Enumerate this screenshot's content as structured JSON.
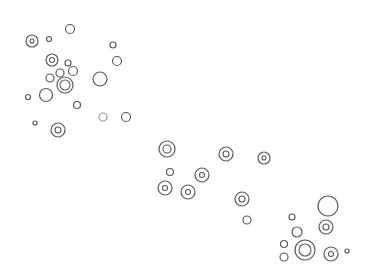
{
  "drawing": {
    "stroke_color": "#5a5a5a",
    "light_stroke_color": "#9a9a9a",
    "background": "#ffffff",
    "circles": [
      {
        "cx": 32,
        "cy": 41,
        "r": 6,
        "inner": 2
      },
      {
        "cx": 49,
        "cy": 39,
        "r": 2.5,
        "inner": 0
      },
      {
        "cx": 70,
        "cy": 29,
        "r": 4.5,
        "inner": 0
      },
      {
        "cx": 113,
        "cy": 45,
        "r": 3,
        "inner": 0
      },
      {
        "cx": 52,
        "cy": 60,
        "r": 6,
        "inner": 2.5
      },
      {
        "cx": 68,
        "cy": 63,
        "r": 3,
        "inner": 0
      },
      {
        "cx": 117,
        "cy": 61,
        "r": 4.5,
        "inner": 0
      },
      {
        "cx": 50,
        "cy": 78,
        "r": 4,
        "inner": 0
      },
      {
        "cx": 60,
        "cy": 73,
        "r": 4,
        "inner": 0
      },
      {
        "cx": 73,
        "cy": 71,
        "r": 4.5,
        "inner": 0
      },
      {
        "cx": 65,
        "cy": 85,
        "r": 8,
        "inner": 5
      },
      {
        "cx": 100,
        "cy": 79,
        "r": 7,
        "inner": 0
      },
      {
        "cx": 28,
        "cy": 97,
        "r": 2.5,
        "inner": 0
      },
      {
        "cx": 46,
        "cy": 95,
        "r": 6.5,
        "inner": 0
      },
      {
        "cx": 77,
        "cy": 105,
        "r": 3.5,
        "inner": 0
      },
      {
        "cx": 103,
        "cy": 117,
        "r": 4,
        "inner": 0,
        "light": true
      },
      {
        "cx": 126,
        "cy": 117,
        "r": 4.5,
        "inner": 0
      },
      {
        "cx": 35,
        "cy": 123,
        "r": 2,
        "inner": 0
      },
      {
        "cx": 58,
        "cy": 130,
        "r": 7,
        "inner": 3
      },
      {
        "cx": 167,
        "cy": 149,
        "r": 8,
        "inner": 4
      },
      {
        "cx": 226,
        "cy": 154,
        "r": 7,
        "inner": 3
      },
      {
        "cx": 264,
        "cy": 158,
        "r": 6,
        "inner": 2
      },
      {
        "cx": 170,
        "cy": 172,
        "r": 3.5,
        "inner": 0
      },
      {
        "cx": 202,
        "cy": 175,
        "r": 7,
        "inner": 2.5
      },
      {
        "cx": 165,
        "cy": 188,
        "r": 7,
        "inner": 2.5
      },
      {
        "cx": 188,
        "cy": 192,
        "r": 7,
        "inner": 2.5
      },
      {
        "cx": 242,
        "cy": 199,
        "r": 7,
        "inner": 3
      },
      {
        "cx": 247,
        "cy": 220,
        "r": 4,
        "inner": 0
      },
      {
        "cx": 328,
        "cy": 206,
        "r": 10,
        "inner": 0
      },
      {
        "cx": 292,
        "cy": 217,
        "r": 3,
        "inner": 0
      },
      {
        "cx": 326,
        "cy": 227,
        "r": 7,
        "inner": 3
      },
      {
        "cx": 297,
        "cy": 232,
        "r": 5,
        "inner": 0
      },
      {
        "cx": 284,
        "cy": 244,
        "r": 3.5,
        "inner": 0
      },
      {
        "cx": 305,
        "cy": 250,
        "r": 10,
        "inner": 6
      },
      {
        "cx": 331,
        "cy": 254,
        "r": 7,
        "inner": 2.5
      },
      {
        "cx": 347,
        "cy": 251,
        "r": 2,
        "inner": 0
      },
      {
        "cx": 284,
        "cy": 257,
        "r": 4,
        "inner": 0
      }
    ]
  }
}
